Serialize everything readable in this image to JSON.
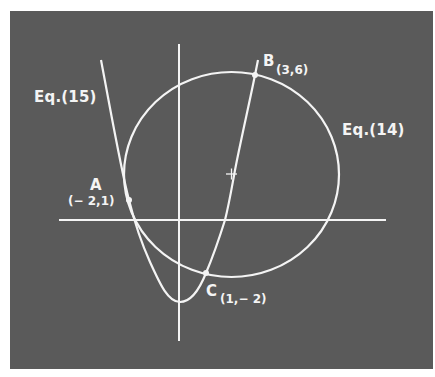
{
  "figure": {
    "background_color": "#5a5a5a",
    "line_color": "#f4f4f4",
    "curves": [
      {
        "id": "circle",
        "label": "Eq. (14)",
        "center": [
          2,
          2
        ],
        "center_marker": "+"
      },
      {
        "id": "parabola",
        "label": "Eq. (15)"
      }
    ],
    "labels": {
      "eq15": "Eq.(15)",
      "eq14": "Eq.(14)",
      "point_a_name": "A",
      "point_a_coord": "(− 2,1)",
      "point_b_name": "B",
      "point_b_coord": "(3,6)",
      "point_c_name": "C",
      "point_c_coord": "(1,− 2)"
    },
    "points": [
      {
        "name": "A",
        "x": -2,
        "y": 1
      },
      {
        "name": "B",
        "x": 3,
        "y": 6
      },
      {
        "name": "C",
        "x": 1,
        "y": -2
      }
    ]
  }
}
